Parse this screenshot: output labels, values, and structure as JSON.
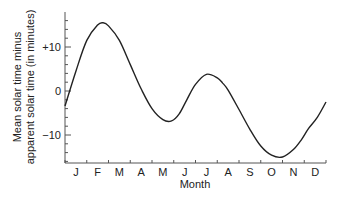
{
  "chart_data": {
    "type": "line",
    "title": "",
    "xlabel": "Month",
    "ylabel_lines": [
      "Mean solar time minus",
      "apparent solar time (in minutes)"
    ],
    "categories": [
      "J",
      "F",
      "M",
      "A",
      "M",
      "J",
      "J",
      "A",
      "S",
      "O",
      "N",
      "D"
    ],
    "yticks": [
      {
        "value": 10,
        "label": "+10"
      },
      {
        "value": 0,
        "label": "0"
      },
      {
        "value": -10,
        "label": "−10"
      }
    ],
    "ylim": [
      -16.5,
      18
    ],
    "xlim": [
      0,
      12
    ],
    "grid": false,
    "legend": null,
    "series": [
      {
        "name": "Equation of time",
        "x": [
          0,
          0.5,
          1.0,
          1.5,
          1.75,
          2.0,
          2.5,
          3.0,
          3.5,
          4.0,
          4.5,
          4.9,
          5.25,
          5.6,
          6.0,
          6.5,
          7.0,
          7.25,
          7.5,
          8.0,
          8.5,
          9.0,
          9.5,
          10.0,
          10.5,
          10.85,
          11.2,
          11.6,
          12.0
        ],
        "values": [
          -3.4,
          4.5,
          11.5,
          15.0,
          15.5,
          14.8,
          11.5,
          6.0,
          0.5,
          -4.0,
          -6.5,
          -6.8,
          -5.2,
          -2.0,
          1.5,
          3.8,
          3.0,
          1.8,
          0.2,
          -4.2,
          -8.7,
          -12.5,
          -14.6,
          -15.0,
          -13.3,
          -11.2,
          -8.5,
          -6.0,
          -2.5
        ]
      }
    ]
  },
  "labels": {
    "ylabel_line1": "Mean solar time minus",
    "ylabel_line2": "apparent solar time (in minutes)",
    "xlabel": "Month"
  }
}
